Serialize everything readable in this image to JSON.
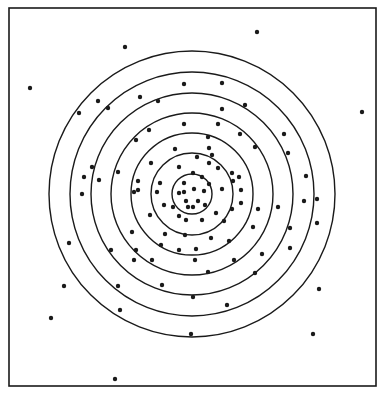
{
  "figure": {
    "colors": {
      "background": "#ffffff",
      "ink": "#1a1a1a"
    },
    "frame": {
      "x": 9,
      "y": 8,
      "width": 367,
      "height": 378
    },
    "center": {
      "x": 192,
      "y": 194
    },
    "ring_radii": [
      20,
      41,
      61,
      81,
      101,
      122,
      143
    ],
    "dot_radius": 2.2,
    "dots": [
      [
        125,
        47
      ],
      [
        30,
        88
      ],
      [
        79,
        113
      ],
      [
        98,
        101
      ],
      [
        108,
        108
      ],
      [
        140,
        97
      ],
      [
        158,
        101
      ],
      [
        184,
        84
      ],
      [
        149,
        130
      ],
      [
        184,
        124
      ],
      [
        257,
        32
      ],
      [
        362,
        112
      ],
      [
        222,
        83
      ],
      [
        245,
        105
      ],
      [
        222,
        109
      ],
      [
        218,
        124
      ],
      [
        240,
        134
      ],
      [
        284,
        134
      ],
      [
        208,
        137
      ],
      [
        136,
        140
      ],
      [
        175,
        149
      ],
      [
        212,
        155
      ],
      [
        92,
        167
      ],
      [
        84,
        177
      ],
      [
        118,
        172
      ],
      [
        151,
        163
      ],
      [
        197,
        157
      ],
      [
        209,
        163
      ],
      [
        209,
        148
      ],
      [
        255,
        147
      ],
      [
        288,
        153
      ],
      [
        306,
        176
      ],
      [
        179,
        167
      ],
      [
        193,
        173
      ],
      [
        218,
        168
      ],
      [
        232,
        173
      ],
      [
        202,
        177
      ],
      [
        239,
        177
      ],
      [
        138,
        181
      ],
      [
        138,
        190
      ],
      [
        99,
        180
      ],
      [
        82,
        194
      ],
      [
        134,
        192
      ],
      [
        160,
        183
      ],
      [
        157,
        192
      ],
      [
        184,
        183
      ],
      [
        184,
        192
      ],
      [
        194,
        189
      ],
      [
        204,
        191
      ],
      [
        209,
        184
      ],
      [
        233,
        181
      ],
      [
        222,
        189
      ],
      [
        241,
        190
      ],
      [
        186,
        201
      ],
      [
        179,
        193
      ],
      [
        193,
        207
      ],
      [
        198,
        201
      ],
      [
        188,
        207
      ],
      [
        205,
        205
      ],
      [
        164,
        205
      ],
      [
        173,
        207
      ],
      [
        179,
        216
      ],
      [
        216,
        213
      ],
      [
        232,
        209
      ],
      [
        241,
        203
      ],
      [
        258,
        209
      ],
      [
        278,
        207
      ],
      [
        304,
        201
      ],
      [
        317,
        199
      ],
      [
        150,
        215
      ],
      [
        186,
        220
      ],
      [
        202,
        220
      ],
      [
        224,
        221
      ],
      [
        253,
        227
      ],
      [
        317,
        223
      ],
      [
        132,
        232
      ],
      [
        165,
        234
      ],
      [
        185,
        235
      ],
      [
        211,
        238
      ],
      [
        229,
        241
      ],
      [
        290,
        228
      ],
      [
        69,
        243
      ],
      [
        161,
        245
      ],
      [
        196,
        249
      ],
      [
        179,
        250
      ],
      [
        136,
        250
      ],
      [
        290,
        248
      ],
      [
        111,
        250
      ],
      [
        262,
        254
      ],
      [
        134,
        260
      ],
      [
        152,
        260
      ],
      [
        195,
        260
      ],
      [
        234,
        260
      ],
      [
        208,
        272
      ],
      [
        255,
        273
      ],
      [
        64,
        286
      ],
      [
        118,
        286
      ],
      [
        162,
        285
      ],
      [
        193,
        297
      ],
      [
        227,
        305
      ],
      [
        120,
        310
      ],
      [
        319,
        289
      ],
      [
        51,
        318
      ],
      [
        191,
        334
      ],
      [
        313,
        334
      ],
      [
        115,
        379
      ]
    ]
  }
}
